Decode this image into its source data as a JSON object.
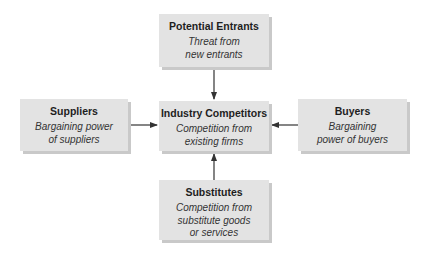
{
  "diagram": {
    "type": "five-forces",
    "nodes": {
      "top": {
        "title": "Potential Entrants",
        "description": "Threat from\nnew entrants"
      },
      "left": {
        "title": "Suppliers",
        "description": "Bargaining power\nof suppliers"
      },
      "center": {
        "title": "Industry Competitors",
        "description": "Competition from\nexisting firms"
      },
      "right": {
        "title": "Buyers",
        "description": "Bargaining\npower of buyers"
      },
      "bottom": {
        "title": "Substitutes",
        "description": "Competition from\nsubstitute goods\nor services"
      }
    },
    "edges": [
      {
        "from": "top",
        "to": "center"
      },
      {
        "from": "left",
        "to": "center"
      },
      {
        "from": "right",
        "to": "center"
      },
      {
        "from": "bottom",
        "to": "center"
      }
    ],
    "colors": {
      "box_fill": "#e3e3e3",
      "box_shadow": "#c9c9c9",
      "arrow": "#333333",
      "text": "#222222"
    }
  }
}
